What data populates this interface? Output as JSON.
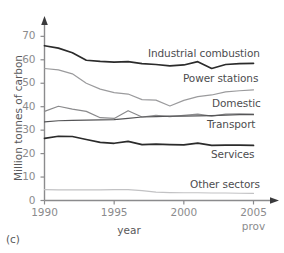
{
  "figure": {
    "panel_label": "(c)",
    "axis_x_title": "year",
    "axis_y_title": "Million tonnes of carbon",
    "prov_note": "prov"
  },
  "axes": {
    "y_ticks": [
      "0",
      "10",
      "20",
      "30",
      "40",
      "50",
      "60",
      "70"
    ],
    "x_ticks": [
      "1990",
      "1995",
      "2000",
      "2005"
    ]
  },
  "labels": {
    "industrial_combustion": "Industrial combustion",
    "power_stations": "Power stations",
    "domestic": "Domestic",
    "transport": "Transport",
    "services": "Services",
    "other_sectors": "Other sectors"
  },
  "colors": {
    "industrial_combustion": "#2b2b2b",
    "power_stations": "#9b9b9d",
    "domestic": "#8a8a8c",
    "transport": "#555557",
    "services": "#2b2b2b",
    "other_sectors": "#c2c2c4",
    "axis": "#7d7d7f",
    "text": "#58585a",
    "tick_text": "#8b8b8d"
  },
  "chart_data": {
    "type": "line",
    "title": "",
    "subtitle": "",
    "xlabel": "year",
    "ylabel": "Million tonnes of carbon",
    "xlim": [
      1990,
      2005
    ],
    "ylim": [
      0,
      73
    ],
    "grid": false,
    "legend_position": "inline-right",
    "x": [
      1990,
      1991,
      1992,
      1993,
      1994,
      1995,
      1996,
      1997,
      1998,
      1999,
      2000,
      2001,
      2002,
      2003,
      2004,
      2005
    ],
    "xticks": [
      1990,
      1995,
      2000,
      2005
    ],
    "yticks": [
      0,
      10,
      20,
      30,
      40,
      50,
      60,
      70
    ],
    "annotations": [
      "prov",
      "(c)"
    ],
    "series": [
      {
        "name": "Industrial combustion",
        "color": "#2b2b2b",
        "values": [
          66.0,
          65.0,
          63.0,
          59.8,
          59.3,
          59.0,
          59.2,
          58.4,
          58.0,
          57.4,
          57.8,
          59.2,
          56.3,
          58.0,
          58.4,
          58.5
        ]
      },
      {
        "name": "Power stations",
        "color": "#9b9b9d",
        "values": [
          56.3,
          55.7,
          54.0,
          50.0,
          47.5,
          46.0,
          45.4,
          43.0,
          42.8,
          40.3,
          42.7,
          44.3,
          45.0,
          46.3,
          46.8,
          47.2
        ]
      },
      {
        "name": "Domestic",
        "color": "#8a8a8c",
        "values": [
          38.0,
          40.2,
          39.0,
          38.0,
          35.3,
          35.0,
          38.3,
          35.6,
          36.3,
          35.8,
          36.3,
          36.8,
          36.0,
          36.8,
          37.0,
          36.8
        ]
      },
      {
        "name": "Transport",
        "color": "#555557",
        "values": [
          33.5,
          34.0,
          34.2,
          34.3,
          34.4,
          34.5,
          35.0,
          35.6,
          35.8,
          36.0,
          36.0,
          36.1,
          36.2,
          36.4,
          36.6,
          36.6
        ]
      },
      {
        "name": "Services",
        "color": "#2b2b2b",
        "values": [
          26.5,
          27.4,
          27.3,
          26.0,
          24.8,
          24.4,
          25.2,
          23.8,
          24.0,
          23.8,
          23.7,
          24.5,
          23.5,
          23.6,
          23.6,
          23.5
        ]
      },
      {
        "name": "Other sectors",
        "color": "#c2c2c4",
        "values": [
          4.6,
          4.5,
          4.5,
          4.5,
          4.5,
          4.6,
          4.6,
          4.2,
          3.6,
          3.4,
          3.3,
          3.3,
          3.2,
          3.2,
          3.1,
          3.0
        ]
      }
    ]
  }
}
